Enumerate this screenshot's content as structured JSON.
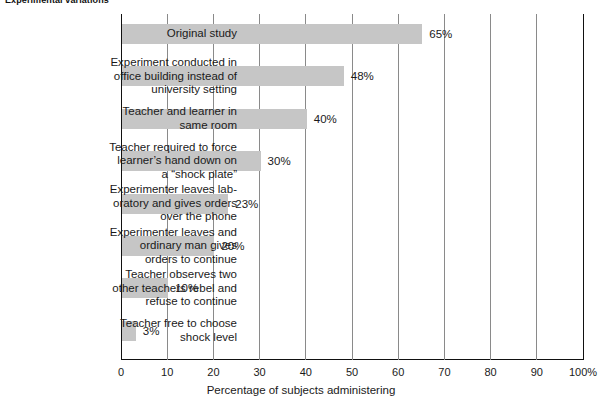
{
  "chart_data": {
    "type": "bar",
    "orientation": "horizontal",
    "title": "Experimental variations",
    "xlabel": "Percentage of subjects administering",
    "ylabel": "",
    "xlim": [
      0,
      100
    ],
    "xticks": [
      {
        "value": 0,
        "label": "0"
      },
      {
        "value": 10,
        "label": "10"
      },
      {
        "value": 20,
        "label": "20"
      },
      {
        "value": 30,
        "label": "30"
      },
      {
        "value": 40,
        "label": "40"
      },
      {
        "value": 50,
        "label": "50"
      },
      {
        "value": 60,
        "label": "60"
      },
      {
        "value": 70,
        "label": "70"
      },
      {
        "value": 80,
        "label": "80"
      },
      {
        "value": 90,
        "label": "90"
      },
      {
        "value": 100,
        "label": "100%"
      }
    ],
    "grid": "vertical",
    "legend": "none",
    "bar_color": "#c6c6c6",
    "categories": [
      "Original study",
      "Experiment conducted in office building instead of university setting",
      "Teacher and learner in same room",
      "Teacher required to force learner’s hand down on a “shock plate”",
      "Experimenter leaves lab-oratory and gives orders over the phone",
      "Experimenter leaves and ordinary man gives orders to continue",
      "Teacher observes two other teachers rebel and refuse to continue",
      "Teacher free to choose shock level"
    ],
    "values": [
      65,
      48,
      40,
      30,
      23,
      20,
      10,
      3
    ],
    "data_labels": [
      "65%",
      "48%",
      "40%",
      "30%",
      "23%",
      "20%",
      "10%",
      "3%"
    ],
    "bars": [
      {
        "label_lines": [
          "Original study"
        ],
        "value": 65,
        "data_label": "65%"
      },
      {
        "label_lines": [
          "Experiment conducted in",
          "office building instead of",
          "university setting"
        ],
        "value": 48,
        "data_label": "48%"
      },
      {
        "label_lines": [
          "Teacher and learner in",
          "same room"
        ],
        "value": 40,
        "data_label": "40%"
      },
      {
        "label_lines": [
          "Teacher required to force",
          "learner’s hand down on",
          "a “shock plate”"
        ],
        "value": 30,
        "data_label": "30%"
      },
      {
        "label_lines": [
          "Experimenter leaves lab-",
          "oratory and gives orders",
          "over the phone"
        ],
        "value": 23,
        "data_label": "23%"
      },
      {
        "label_lines": [
          "Experimenter leaves and",
          "ordinary man gives",
          "orders to continue"
        ],
        "value": 20,
        "data_label": "20%"
      },
      {
        "label_lines": [
          "Teacher observes two",
          "other teachers rebel and",
          "refuse to continue"
        ],
        "value": 10,
        "data_label": "10%"
      },
      {
        "label_lines": [
          "Teacher free to choose",
          "shock level"
        ],
        "value": 3,
        "data_label": "3%"
      }
    ]
  }
}
